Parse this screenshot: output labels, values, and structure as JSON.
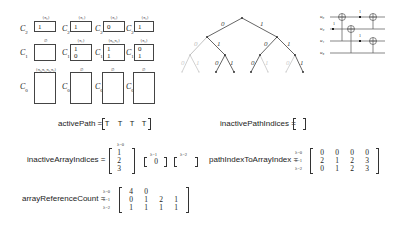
{
  "memory_blocks": {
    "top_row": [
      {
        "name": "C",
        "sub": "2",
        "tag": "{π₀}",
        "value": "1"
      },
      {
        "name": "C",
        "sub": "2",
        "tag": "{π₁}",
        "value": "1"
      },
      {
        "name": "C",
        "sub": "2",
        "tag": "{π₂}",
        "value": "0"
      },
      {
        "name": "C",
        "sub": "2",
        "tag": "{π₃}",
        "value": "1"
      }
    ],
    "mid_row": [
      {
        "name": "C",
        "sub": "1",
        "tag": "∅",
        "values": [
          "",
          ""
        ]
      },
      {
        "name": "C",
        "sub": "1",
        "tag": "{π₁}",
        "values": [
          "1",
          "0"
        ]
      },
      {
        "name": "C",
        "sub": "1",
        "tag": "{π₀,π₂}",
        "values": [
          "1",
          "1"
        ]
      },
      {
        "name": "C",
        "sub": "1",
        "tag": "{π₃}",
        "values": [
          "0",
          "1"
        ]
      }
    ],
    "bottom_row": [
      {
        "name": "C",
        "sub": "0",
        "tag": "{π₀,π₁,π₂,π₃}"
      },
      {
        "name": "C",
        "sub": "0",
        "tag": "∅"
      },
      {
        "name": "C",
        "sub": "0",
        "tag": "∅"
      },
      {
        "name": "C",
        "sub": "0",
        "tag": "∅"
      }
    ]
  },
  "tree": {
    "edge_labels": {
      "left": "0",
      "right": "1"
    }
  },
  "circuit": {
    "wires": [
      "u₀",
      "u₂",
      "u₁",
      "u₃"
    ],
    "control_labels": [
      "1",
      "1",
      "1"
    ]
  },
  "equations": {
    "activePath": {
      "label": "activePath =",
      "values": [
        "T",
        "T",
        "T",
        "T"
      ]
    },
    "inactivePathIndices": {
      "label": "inactivePathIndices =",
      "values": []
    },
    "inactiveArrayIndices": {
      "label": "inactiveArrayIndices =",
      "groups": [
        {
          "lambda": "λ=0",
          "values": [
            "1",
            "2",
            "3"
          ]
        },
        {
          "lambda": "λ=1",
          "values": [
            "0"
          ]
        },
        {
          "lambda": "λ=2",
          "values": []
        }
      ]
    },
    "pathIndexToArrayIndex": {
      "label": "pathIndexToArrayIndex =",
      "row_labels": [
        "λ=0",
        "λ=1",
        "λ=2"
      ],
      "rows": [
        [
          "0",
          "0",
          "0",
          "0"
        ],
        [
          "2",
          "1",
          "2",
          "3"
        ],
        [
          "0",
          "1",
          "2",
          "3"
        ]
      ]
    },
    "arrayReferenceCount": {
      "label": "arrayReferenceCount =",
      "row_labels": [
        "λ=0",
        "λ=1",
        "λ=2"
      ],
      "rows": [
        [
          "4",
          "0",
          "",
          ""
        ],
        [
          "0",
          "1",
          "2",
          "1"
        ],
        [
          "1",
          "1",
          "1",
          "1"
        ]
      ]
    }
  }
}
